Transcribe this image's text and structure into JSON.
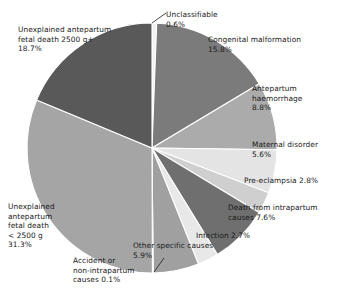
{
  "chart_data": {
    "type": "pie",
    "title": "",
    "subtitle": "",
    "xlabel": "",
    "ylabel": "",
    "legend_position": "labels-outside",
    "grid": false,
    "start_angle_deg": 0,
    "direction": "clockwise",
    "units": "percent",
    "total": 100,
    "categories": [
      "Unclassifiable",
      "Congenital malformation",
      "Antepartum haemorrhage",
      "Maternal disorder",
      "Pre-eclampsia",
      "Death from intrapartum causes",
      "Infection",
      "Other specific causes",
      "Accident or non-intrapartum causes",
      "Unexplained antepartum fetal death <2500 g",
      "Unexplained antepartum fetal death 2500 g+"
    ],
    "values": [
      0.6,
      15.8,
      8.8,
      5.6,
      2.8,
      7.6,
      2.7,
      5.9,
      0.1,
      31.3,
      18.7
    ],
    "colors": [
      "#f2f2f2",
      "#7b7b7b",
      "#ababab",
      "#e4e4e4",
      "#cfcfcf",
      "#6f6f6f",
      "#e8e8e8",
      "#a0a0a0",
      "#f4f4f4",
      "#a5a5a5",
      "#595959"
    ],
    "slices": [
      {
        "label": "Unclassifiable",
        "value": 0.6,
        "value_text": "0.6%",
        "color": "#f2f2f2"
      },
      {
        "label": "Congenital malformation",
        "value": 15.8,
        "value_text": "15.8%",
        "color": "#7b7b7b"
      },
      {
        "label": "Antepartum haemorrhage",
        "value": 8.8,
        "value_text": "8.8%",
        "color": "#ababab"
      },
      {
        "label": "Maternal disorder",
        "value": 5.6,
        "value_text": "5.6%",
        "color": "#e4e4e4"
      },
      {
        "label": "Pre-eclampsia",
        "value": 2.8,
        "value_text": "2.8%",
        "color": "#cfcfcf"
      },
      {
        "label": "Death from intrapartum causes",
        "value": 7.6,
        "value_text": "7.6%",
        "color": "#6f6f6f"
      },
      {
        "label": "Infection",
        "value": 2.7,
        "value_text": "2.7%",
        "color": "#e8e8e8"
      },
      {
        "label": "Other specific causes",
        "value": 5.9,
        "value_text": "5.9%",
        "color": "#a0a0a0"
      },
      {
        "label": "Accident or non-intrapartum causes",
        "value": 0.1,
        "value_text": "0.1%",
        "color": "#f4f4f4"
      },
      {
        "label": "Unexplained antepartum fetal death <2500 g",
        "value": 31.3,
        "value_text": "31.3%",
        "color": "#a5a5a5"
      },
      {
        "label": "Unexplained antepartum fetal death 2500 g+",
        "value": 18.7,
        "value_text": "18.7%",
        "color": "#595959"
      }
    ]
  },
  "labels": {
    "unclassifiable": "Unclassifiable\n0.6%",
    "congenital": "Congenital malformation\n15.8%",
    "haemorrhage": "Antepartum\nhaemorrhage\n8.8%",
    "maternal": "Maternal disorder\n5.6%",
    "preeclampsia": "Pre-eclampsia 2.8%",
    "intrapartum": "Death from intrapartum\ncauses 7.6%",
    "infection": "Infection 2.7%",
    "other": "Other specific causes\n5.9%",
    "accident": "Accident or\nnon-intrapartum\ncauses 0.1%",
    "unexp_small": "Unexplained\nantepartum\nfetal death\n< 2500 g\n31.3%",
    "unexp_large": "Unexplained antepartum\nfetal death 2500 g+\n18.7%"
  }
}
